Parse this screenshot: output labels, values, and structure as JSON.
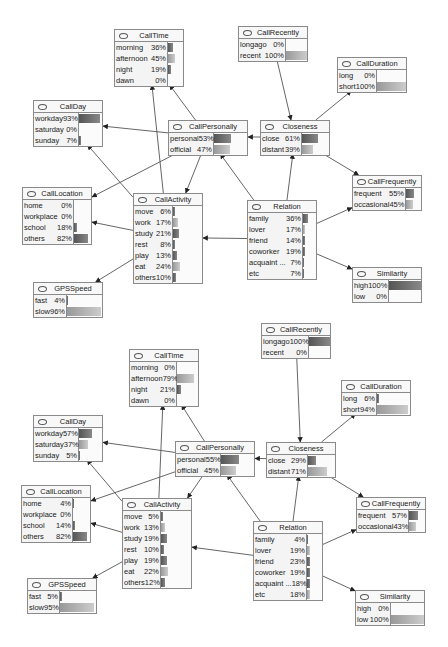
{
  "diagrams": [
    {
      "name": "top",
      "nodes": [
        {
          "id": "CallTime",
          "title": "CallTime",
          "x": 114,
          "y": 29,
          "lw": 52,
          "w": 70,
          "states": [
            {
              "label": "morning",
              "pct": "36%",
              "v": 36
            },
            {
              "label": "afternoon",
              "pct": "45%",
              "v": 45,
              "light": true
            },
            {
              "label": "night",
              "pct": "19%",
              "v": 19
            },
            {
              "label": "dawn",
              "pct": "0%",
              "v": 0
            }
          ]
        },
        {
          "id": "CallRecently",
          "title": "CallRecently",
          "x": 238,
          "y": 26,
          "lw": 46,
          "w": 70,
          "states": [
            {
              "label": "longago",
              "pct": "0%",
              "v": 0
            },
            {
              "label": "recent",
              "pct": "100%",
              "v": 100,
              "light": true
            }
          ]
        },
        {
          "id": "CallDuration",
          "title": "CallDuration",
          "x": 337,
          "y": 57,
          "lw": 38,
          "w": 70,
          "states": [
            {
              "label": "long",
              "pct": "0%",
              "v": 0
            },
            {
              "label": "short",
              "pct": "100%",
              "v": 100,
              "light": true
            }
          ]
        },
        {
          "id": "CallDay",
          "title": "CallDay",
          "x": 33,
          "y": 100,
          "lw": 44,
          "w": 70,
          "states": [
            {
              "label": "workday",
              "pct": "93%",
              "v": 93
            },
            {
              "label": "saturday",
              "pct": "0%",
              "v": 0
            },
            {
              "label": "sunday",
              "pct": "7%",
              "v": 7
            }
          ]
        },
        {
          "id": "CallPersonally",
          "title": "CallPersonally",
          "x": 168,
          "y": 120,
          "lw": 44,
          "w": 80,
          "states": [
            {
              "label": "personal",
              "pct": "53%",
              "v": 53
            },
            {
              "label": "official",
              "pct": "47%",
              "v": 47,
              "light": true
            }
          ]
        },
        {
          "id": "Closeness",
          "title": "Closeness",
          "x": 260,
          "y": 120,
          "lw": 40,
          "w": 70,
          "states": [
            {
              "label": "close",
              "pct": "61%",
              "v": 61
            },
            {
              "label": "distant",
              "pct": "39%",
              "v": 39,
              "light": true
            }
          ]
        },
        {
          "id": "CallFrequently",
          "title": "CallFrequently",
          "x": 352,
          "y": 175,
          "lw": 52,
          "w": 70,
          "states": [
            {
              "label": "frequent",
              "pct": "55%",
              "v": 55
            },
            {
              "label": "occasional",
              "pct": "45%",
              "v": 45,
              "light": true
            }
          ]
        },
        {
          "id": "CallLocation",
          "title": "CallLocation",
          "x": 22,
          "y": 187,
          "lw": 50,
          "w": 70,
          "states": [
            {
              "label": "home",
              "pct": "0%",
              "v": 0
            },
            {
              "label": "workplace",
              "pct": "0%",
              "v": 0
            },
            {
              "label": "school",
              "pct": "18%",
              "v": 18
            },
            {
              "label": "others",
              "pct": "82%",
              "v": 82
            }
          ]
        },
        {
          "id": "CallActivity",
          "title": "CallActivity",
          "x": 133,
          "y": 193,
          "lw": 38,
          "w": 70,
          "states": [
            {
              "label": "move",
              "pct": "6%",
              "v": 6
            },
            {
              "label": "work",
              "pct": "17%",
              "v": 17,
              "light": true
            },
            {
              "label": "study",
              "pct": "21%",
              "v": 21
            },
            {
              "label": "rest",
              "pct": "8%",
              "v": 8
            },
            {
              "label": "play",
              "pct": "13%",
              "v": 13
            },
            {
              "label": "eat",
              "pct": "24%",
              "v": 24,
              "light": true
            },
            {
              "label": "others",
              "pct": "10%",
              "v": 10
            }
          ]
        },
        {
          "id": "Relation",
          "title": "Relation",
          "x": 247,
          "y": 200,
          "lw": 54,
          "w": 70,
          "states": [
            {
              "label": "family",
              "pct": "36%",
              "v": 36
            },
            {
              "label": "lover",
              "pct": "17%",
              "v": 17,
              "light": true
            },
            {
              "label": "friend",
              "pct": "14%",
              "v": 14
            },
            {
              "label": "coworker",
              "pct": "19%",
              "v": 19
            },
            {
              "label": "acquaint ...",
              "pct": "7%",
              "v": 7
            },
            {
              "label": "etc",
              "pct": "7%",
              "v": 7
            }
          ]
        },
        {
          "id": "Similarity",
          "title": "Similarity",
          "x": 352,
          "y": 267,
          "lw": 35,
          "w": 70,
          "states": [
            {
              "label": "high",
              "pct": "100%",
              "v": 100
            },
            {
              "label": "low",
              "pct": "0%",
              "v": 0
            }
          ]
        },
        {
          "id": "GPSSpeed",
          "title": "GPSSpeed",
          "x": 33,
          "y": 282,
          "lw": 32,
          "w": 70,
          "states": [
            {
              "label": "fast",
              "pct": "4%",
              "v": 4
            },
            {
              "label": "slow",
              "pct": "96%",
              "v": 96,
              "light": true
            }
          ]
        }
      ]
    },
    {
      "name": "bottom",
      "nodes": [
        {
          "id": "CallTime",
          "title": "CallTime",
          "x": 129,
          "y": 349,
          "lw": 46,
          "w": 70,
          "states": [
            {
              "label": "morning",
              "pct": "0%",
              "v": 0
            },
            {
              "label": "afternoon",
              "pct": "79%",
              "v": 79,
              "light": true
            },
            {
              "label": "night",
              "pct": "21%",
              "v": 21
            },
            {
              "label": "dawn",
              "pct": "0%",
              "v": 0
            }
          ]
        },
        {
          "id": "CallRecently",
          "title": "CallRecently",
          "x": 261,
          "y": 323,
          "lw": 46,
          "w": 70,
          "states": [
            {
              "label": "longago",
              "pct": "100%",
              "v": 100
            },
            {
              "label": "recent",
              "pct": "0%",
              "v": 0
            }
          ]
        },
        {
          "id": "CallDuration",
          "title": "CallDuration",
          "x": 341,
          "y": 380,
          "lw": 34,
          "w": 70,
          "states": [
            {
              "label": "long",
              "pct": "6%",
              "v": 6
            },
            {
              "label": "short",
              "pct": "94%",
              "v": 94,
              "light": true
            }
          ]
        },
        {
          "id": "CallDay",
          "title": "CallDay",
          "x": 33,
          "y": 415,
          "lw": 44,
          "w": 70,
          "states": [
            {
              "label": "workday",
              "pct": "57%",
              "v": 57
            },
            {
              "label": "saturday",
              "pct": "37%",
              "v": 37,
              "light": true
            },
            {
              "label": "sunday",
              "pct": "5%",
              "v": 5
            }
          ]
        },
        {
          "id": "CallPersonally",
          "title": "CallPersonally",
          "x": 175,
          "y": 441,
          "lw": 44,
          "w": 80,
          "states": [
            {
              "label": "personal",
              "pct": "55%",
              "v": 55
            },
            {
              "label": "official",
              "pct": "45%",
              "v": 45,
              "light": true
            }
          ]
        },
        {
          "id": "Closeness",
          "title": "Closeness",
          "x": 266,
          "y": 442,
          "lw": 40,
          "w": 70,
          "states": [
            {
              "label": "close",
              "pct": "29%",
              "v": 29
            },
            {
              "label": "distant",
              "pct": "71%",
              "v": 71,
              "light": true
            }
          ]
        },
        {
          "id": "CallFrequently",
          "title": "CallFrequently",
          "x": 356,
          "y": 497,
          "lw": 51,
          "w": 70,
          "states": [
            {
              "label": "frequent",
              "pct": "57%",
              "v": 57
            },
            {
              "label": "occasional",
              "pct": "43%",
              "v": 43,
              "light": true
            }
          ]
        },
        {
          "id": "CallLocation",
          "title": "CallLocation",
          "x": 21,
          "y": 485,
          "lw": 50,
          "w": 70,
          "states": [
            {
              "label": "home",
              "pct": "4%",
              "v": 4
            },
            {
              "label": "workplace",
              "pct": "0%",
              "v": 0
            },
            {
              "label": "school",
              "pct": "14%",
              "v": 14
            },
            {
              "label": "others",
              "pct": "82%",
              "v": 82
            }
          ]
        },
        {
          "id": "CallActivity",
          "title": "CallActivity",
          "x": 122,
          "y": 498,
          "lw": 37,
          "w": 70,
          "states": [
            {
              "label": "move",
              "pct": "5%",
              "v": 5
            },
            {
              "label": "work",
              "pct": "13%",
              "v": 13,
              "light": true
            },
            {
              "label": "study",
              "pct": "19%",
              "v": 19
            },
            {
              "label": "rest",
              "pct": "10%",
              "v": 10
            },
            {
              "label": "play",
              "pct": "19%",
              "v": 19
            },
            {
              "label": "eat",
              "pct": "22%",
              "v": 22,
              "light": true
            },
            {
              "label": "others",
              "pct": "12%",
              "v": 12
            }
          ]
        },
        {
          "id": "Relation",
          "title": "Relation",
          "x": 253,
          "y": 521,
          "lw": 52,
          "w": 70,
          "states": [
            {
              "label": "family",
              "pct": "4%",
              "v": 4
            },
            {
              "label": "lover",
              "pct": "19%",
              "v": 19,
              "light": true
            },
            {
              "label": "friend",
              "pct": "23%",
              "v": 23
            },
            {
              "label": "coworker",
              "pct": "19%",
              "v": 19
            },
            {
              "label": "acquaint ...",
              "pct": "18%",
              "v": 18
            },
            {
              "label": "etc",
              "pct": "18%",
              "v": 18,
              "light": true
            }
          ]
        },
        {
          "id": "Similarity",
          "title": "Similarity",
          "x": 355,
          "y": 590,
          "lw": 34,
          "w": 70,
          "states": [
            {
              "label": "high",
              "pct": "0%",
              "v": 0
            },
            {
              "label": "low",
              "pct": "100%",
              "v": 100,
              "light": true
            }
          ]
        },
        {
          "id": "GPSSpeed",
          "title": "GPSSpeed",
          "x": 27,
          "y": 578,
          "lw": 31,
          "w": 70,
          "states": [
            {
              "label": "fast",
              "pct": "5%",
              "v": 5
            },
            {
              "label": "slow",
              "pct": "95%",
              "v": 95,
              "light": true
            }
          ]
        }
      ]
    }
  ],
  "edges": [
    {
      "from": "CallRecently",
      "to": "Closeness"
    },
    {
      "from": "Closeness",
      "to": "CallDuration"
    },
    {
      "from": "Closeness",
      "to": "CallPersonally"
    },
    {
      "from": "Closeness",
      "to": "CallFrequently"
    },
    {
      "from": "CallPersonally",
      "to": "CallTime"
    },
    {
      "from": "CallPersonally",
      "to": "CallDay"
    },
    {
      "from": "CallPersonally",
      "to": "CallLocation"
    },
    {
      "from": "CallPersonally",
      "to": "CallActivity"
    },
    {
      "from": "CallActivity",
      "to": "CallTime"
    },
    {
      "from": "CallActivity",
      "to": "CallDay"
    },
    {
      "from": "CallActivity",
      "to": "CallLocation"
    },
    {
      "from": "CallActivity",
      "to": "GPSSpeed"
    },
    {
      "from": "Relation",
      "to": "CallActivity"
    },
    {
      "from": "Relation",
      "to": "CallPersonally"
    },
    {
      "from": "Relation",
      "to": "Closeness"
    },
    {
      "from": "Relation",
      "to": "CallFrequently"
    },
    {
      "from": "Relation",
      "to": "Similarity"
    }
  ]
}
